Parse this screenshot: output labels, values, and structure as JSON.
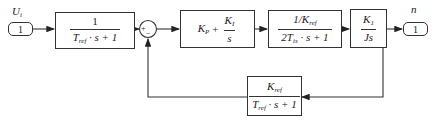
{
  "diagram": {
    "type": "block_diagram",
    "input": {
      "label": "U",
      "label_sub": "i",
      "port_number": "1"
    },
    "output": {
      "label": "n",
      "port_number": "1"
    },
    "sum_junction": {
      "signs": [
        "+",
        "−"
      ]
    },
    "blocks": [
      {
        "id": "prefilter",
        "num": "1",
        "den_pre": "T",
        "den_sub": "ref",
        "den_post": " · s + 1"
      },
      {
        "id": "pi_controller",
        "kp": "K",
        "kp_sub": "P",
        "plus": "+",
        "ki": "K",
        "ki_sub": "I",
        "ki_den": "s"
      },
      {
        "id": "current_loop",
        "num_pre": "1/K",
        "num_sub": "ref",
        "den_pre": "2T",
        "den_sub": "is",
        "den_post": " · s + 1"
      },
      {
        "id": "mechanical",
        "num": "K",
        "num_sub": "1",
        "den": "Js"
      },
      {
        "id": "feedback",
        "num": "K",
        "num_sub": "ref",
        "den_pre": "T",
        "den_sub": "ref",
        "den_post": " · s + 1"
      }
    ]
  }
}
